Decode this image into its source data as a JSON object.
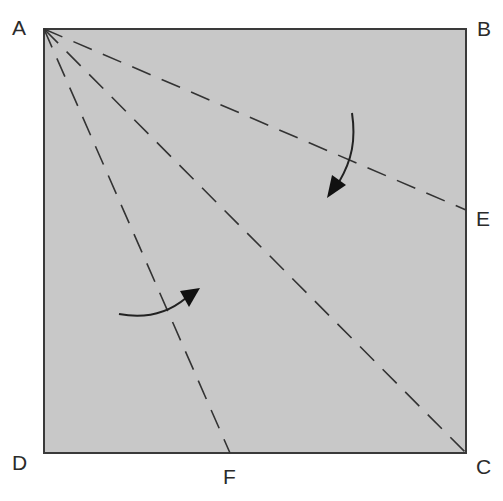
{
  "diagram": {
    "type": "origami-fold-diagram",
    "paper": {
      "fill": "#c8c8c8",
      "stroke": "#3a3a3a",
      "corners": {
        "A": [
          44,
          29
        ],
        "B": [
          466,
          29
        ],
        "C": [
          466,
          453
        ],
        "D": [
          44,
          453
        ]
      }
    },
    "points": {
      "E": [
        466,
        210
      ],
      "F": [
        230,
        453
      ]
    },
    "labels": [
      {
        "id": "A",
        "text": "A",
        "x": 12,
        "y": 17
      },
      {
        "id": "B",
        "text": "B",
        "x": 477,
        "y": 18
      },
      {
        "id": "E",
        "text": "E",
        "x": 476,
        "y": 208
      },
      {
        "id": "D",
        "text": "D",
        "x": 12,
        "y": 452
      },
      {
        "id": "F",
        "text": "F",
        "x": 223,
        "y": 466
      },
      {
        "id": "C",
        "text": "C",
        "x": 476,
        "y": 456
      }
    ],
    "fold_lines": [
      {
        "name": "valley-fold-AE",
        "from": "A",
        "to": "E",
        "style": "dashed"
      },
      {
        "name": "valley-fold-AC",
        "from": "A",
        "to": "C",
        "style": "dashed"
      },
      {
        "name": "valley-fold-AF",
        "from": "A",
        "to": "F",
        "style": "dashed"
      }
    ],
    "arrows": [
      {
        "name": "fold-arrow-top-edge-down",
        "direction": "fold AB down to AC"
      },
      {
        "name": "fold-arrow-left-edge-right",
        "direction": "fold AD right to AC"
      }
    ],
    "colors": {
      "paper": "#c8c8c8",
      "line": "#333333",
      "label": "#2b2b2b",
      "background": "#ffffff"
    }
  }
}
